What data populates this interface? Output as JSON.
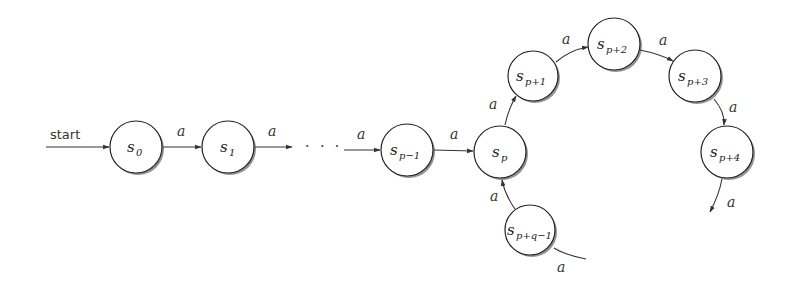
{
  "diagram": {
    "type": "finite-automaton",
    "start_label": "start",
    "ellipsis": "· · ·",
    "edge_symbol": "a",
    "states": [
      {
        "id": "s0",
        "base": "s",
        "sub": "0",
        "cx": 136,
        "cy": 147
      },
      {
        "id": "s1",
        "base": "s",
        "sub": "1",
        "cx": 228,
        "cy": 147
      },
      {
        "id": "sp-1",
        "base": "s",
        "sub": "p−1",
        "cx": 407,
        "cy": 150
      },
      {
        "id": "sp",
        "base": "s",
        "sub": "p",
        "cx": 500,
        "cy": 152
      },
      {
        "id": "sp+1",
        "base": "s",
        "sub": "p+1",
        "cx": 533,
        "cy": 76
      },
      {
        "id": "sp+2",
        "base": "s",
        "sub": "p+2",
        "cx": 614,
        "cy": 44
      },
      {
        "id": "sp+3",
        "base": "s",
        "sub": "p+3",
        "cx": 695,
        "cy": 76
      },
      {
        "id": "sp+4",
        "base": "s",
        "sub": "p+4",
        "cx": 727,
        "cy": 152
      },
      {
        "id": "sp+q-1",
        "base": "s",
        "sub": "p+q−1",
        "cx": 530,
        "cy": 230
      }
    ],
    "edges": [
      {
        "from": "start",
        "to": "s0",
        "label": "start"
      },
      {
        "from": "s0",
        "to": "s1",
        "label": "a"
      },
      {
        "from": "s1",
        "to": "ellipsis",
        "label": "a"
      },
      {
        "from": "ellipsis",
        "to": "sp-1",
        "label": "a"
      },
      {
        "from": "sp-1",
        "to": "sp",
        "label": "a"
      },
      {
        "from": "sp",
        "to": "sp+1",
        "label": "a"
      },
      {
        "from": "sp+1",
        "to": "sp+2",
        "label": "a"
      },
      {
        "from": "sp+2",
        "to": "sp+3",
        "label": "a"
      },
      {
        "from": "sp+3",
        "to": "sp+4",
        "label": "a"
      },
      {
        "from": "sp+4",
        "to": "continue",
        "label": "a"
      },
      {
        "from": "incoming",
        "to": "sp+q-1",
        "label": "a"
      },
      {
        "from": "sp+q-1",
        "to": "sp",
        "label": "a"
      }
    ]
  }
}
